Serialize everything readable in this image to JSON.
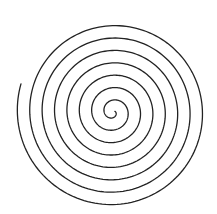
{
  "diagram": {
    "background": "#ffffff",
    "stroke_color": "#222222",
    "stroke_width": 1.3,
    "center": [
      113,
      112
    ],
    "pixels_per_turn": 12.4,
    "start_radius": 2,
    "turns": 7.6,
    "end_angle_deg": 197,
    "direction": "counterclockwise-outward"
  }
}
